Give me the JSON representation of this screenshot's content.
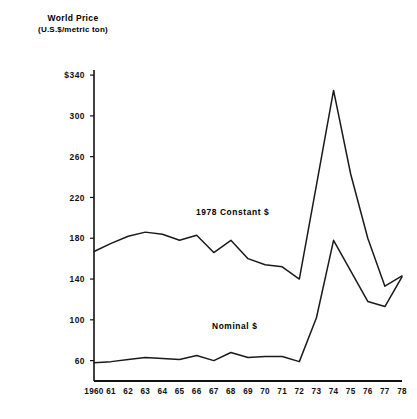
{
  "header": {
    "title_line1": "World Price",
    "title_line2": "(U.S.$/metric ton)"
  },
  "chart_data": {
    "type": "line",
    "title": "World Price",
    "subtitle": "(U.S.$/metric ton)",
    "xlabel": "",
    "ylabel": "World Price (U.S.$/metric ton)",
    "grid": false,
    "legend_position": "inline-annotation",
    "ylim": [
      40,
      345
    ],
    "yticks": [
      60,
      100,
      140,
      180,
      220,
      260,
      300,
      340
    ],
    "ytick_labels": [
      "60",
      "100",
      "140",
      "180",
      "220",
      "260",
      "300",
      "$340"
    ],
    "x": [
      1960,
      1961,
      1962,
      1963,
      1964,
      1965,
      1966,
      1967,
      1968,
      1969,
      1970,
      1971,
      1972,
      1973,
      1974,
      1975,
      1976,
      1977,
      1978
    ],
    "xtick_labels": [
      "1960",
      "61",
      "62",
      "63",
      "64",
      "65",
      "66",
      "67",
      "68",
      "69",
      "70",
      "71",
      "72",
      "73",
      "74",
      "75",
      "76",
      "77",
      "78"
    ],
    "series": [
      {
        "name": "1978 Constant $",
        "values": [
          167,
          175,
          182,
          186,
          184,
          178,
          183,
          166,
          178,
          160,
          154,
          152,
          140,
          232,
          325,
          243,
          180,
          133,
          143
        ]
      },
      {
        "name": "Nominal $",
        "values": [
          58,
          59,
          61,
          63,
          62,
          61,
          65,
          60,
          68,
          63,
          64,
          64,
          59,
          102,
          178,
          148,
          118,
          113,
          142
        ]
      }
    ],
    "annotations": [
      {
        "text": "1978 Constant $",
        "series": "1978 Constant $"
      },
      {
        "text": "Nominal $",
        "series": "Nominal $"
      }
    ]
  }
}
